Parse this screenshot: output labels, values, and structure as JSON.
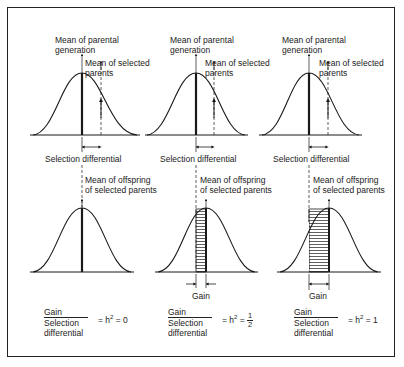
{
  "figure": {
    "panels": [
      {
        "id": "h2-zero",
        "parental_label_1": "Mean of parental",
        "parental_label_2": "generation",
        "selected_label_1": "Mean of selected",
        "selected_label_2": "parents",
        "selection_differential_label": "Selection differential",
        "offspring_label_1": "Mean of offspring",
        "offspring_label_2": "of selected parents",
        "gain_label": "",
        "formula": {
          "numerator": "Gain",
          "denominator_1": "Selection",
          "denominator_2": "differential",
          "equals": "= h",
          "exp": "2",
          "result": " = 0",
          "result_fraction": null
        }
      },
      {
        "id": "h2-half",
        "parental_label_1": "Mean of parental",
        "parental_label_2": "generation",
        "selected_label_1": "Mean of selected",
        "selected_label_2": "parents",
        "selection_differential_label": "Selection differential",
        "offspring_label_1": "Mean of offspring",
        "offspring_label_2": "of selected parents",
        "gain_label": "Gain",
        "formula": {
          "numerator": "Gain",
          "denominator_1": "Selection",
          "denominator_2": "differential",
          "equals": "= h",
          "exp": "2",
          "result": " = ",
          "result_fraction": {
            "num": "1",
            "den": "2"
          }
        }
      },
      {
        "id": "h2-one",
        "parental_label_1": "Mean of parental",
        "parental_label_2": "generation",
        "selected_label_1": "Mean of selected",
        "selected_label_2": "parents",
        "selection_differential_label": "Selection differential",
        "offspring_label_1": "Mean of offspring",
        "offspring_label_2": "of selected parents",
        "gain_label": "Gain",
        "formula": {
          "numerator": "Gain",
          "denominator_1": "Selection",
          "denominator_2": "differential",
          "equals": "= h",
          "exp": "2",
          "result": " = 1",
          "result_fraction": null
        }
      }
    ],
    "colors": {
      "ink": "#1a1a1a",
      "background": "#ffffff"
    }
  }
}
